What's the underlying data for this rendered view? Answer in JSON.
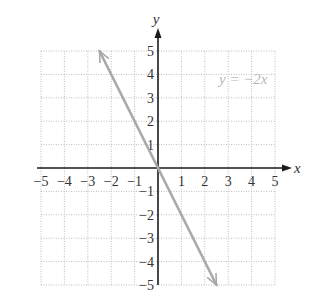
{
  "chart_data": {
    "type": "line",
    "title": "",
    "xlabel": "x",
    "ylabel": "y",
    "xlim": [
      -5,
      5
    ],
    "ylim": [
      -5,
      5
    ],
    "grid": true,
    "grid_style": "dotted",
    "x_ticks": [
      -5,
      -4,
      -3,
      -2,
      -1,
      1,
      2,
      3,
      4,
      5
    ],
    "y_ticks": [
      5,
      4,
      3,
      2,
      1,
      -1,
      -2,
      -3,
      -4,
      -5
    ],
    "x_tick_labels": [
      "−5",
      "−4",
      "−3",
      "−2",
      "−1",
      "1",
      "2",
      "3",
      "4",
      "5"
    ],
    "y_tick_labels": [
      "5",
      "4",
      "3",
      "2",
      "1",
      "−1",
      "−2",
      "−3",
      "−4",
      "−5"
    ],
    "series": [
      {
        "name": "y = −2x",
        "equation": "y = -2x",
        "slope": -2,
        "intercept": 0,
        "x": [
          -2.5,
          -2,
          -1,
          0,
          1,
          2,
          2.5
        ],
        "y": [
          5,
          4,
          2,
          0,
          -2,
          -4,
          -5
        ],
        "arrows_both_ends": true,
        "color": "#a8a8a8"
      }
    ],
    "annotations": [
      {
        "text": "y = −2x",
        "x": 3.2,
        "y": 3.7
      }
    ],
    "legend": null
  },
  "labels": {
    "x_axis": "x",
    "y_axis": "y",
    "equation": "y = −2x"
  },
  "colors": {
    "axis": "#1a1a1a",
    "grid": "#bdbdbd",
    "line": "#a8a8a8",
    "text": "#333333",
    "equation_text": "#b8b8b8"
  }
}
